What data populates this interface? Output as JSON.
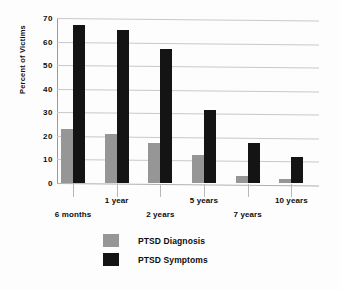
{
  "chart_data": {
    "type": "bar",
    "title": "",
    "xlabel": "",
    "ylabel": "Percent of Victims",
    "ylim": [
      0,
      70
    ],
    "yticks": [
      0,
      10,
      20,
      30,
      40,
      50,
      60,
      70
    ],
    "ytick_labels": [
      "0",
      "10",
      "20",
      "30",
      "40",
      "50",
      "60",
      "70"
    ],
    "grid": true,
    "legend_position": "bottom-center",
    "categories": [
      "6 months",
      "1 year",
      "2 years",
      "5 years",
      "7 years",
      "10 years"
    ],
    "series": [
      {
        "name": "PTSD Diagnosis",
        "color": "#969696",
        "values": [
          23,
          21,
          17,
          12,
          3,
          1.5
        ]
      },
      {
        "name": "PTSD Symptoms",
        "color": "#141414",
        "values": [
          67,
          65,
          57,
          31,
          17,
          11
        ]
      }
    ]
  },
  "legend": {
    "items": [
      {
        "label": "PTSD Diagnosis",
        "swatch_name": "legend-swatch-diagnosis"
      },
      {
        "label": "PTSD Symptoms",
        "swatch_name": "legend-swatch-symptoms"
      }
    ]
  },
  "colors": {
    "diagnosis": "#969696",
    "symptoms": "#141414",
    "gridline": "#c9c9c9",
    "axis": "#9a9a9a",
    "background": "#fdfdfd",
    "text": "#0d0d0d"
  }
}
